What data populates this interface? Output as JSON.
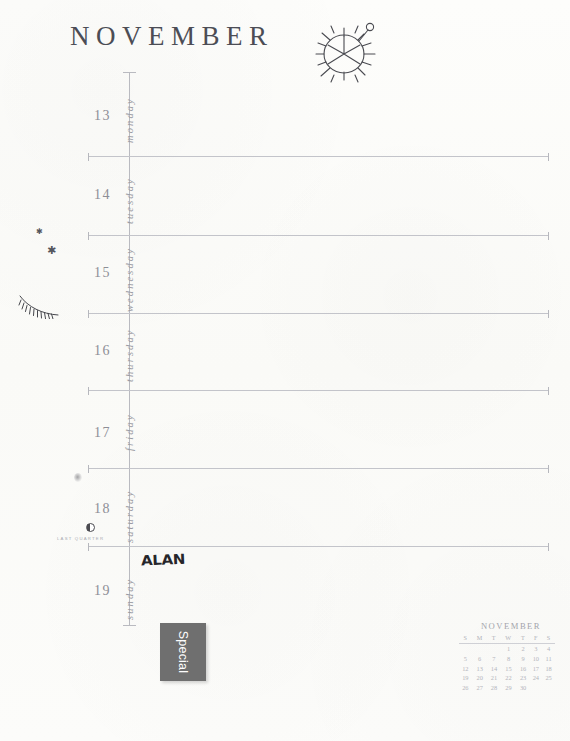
{
  "page": {
    "month_title": "NOVEMBER",
    "paper_color": "#fcfcfa",
    "ink_color": "#8d8e96",
    "rule_color": "#c3c4ca"
  },
  "doodles": {
    "sun_wheel": "sun-wheel-doodle",
    "stars": [
      "star-small",
      "star-large"
    ],
    "eyelash": "eyelash-doodle"
  },
  "days": [
    {
      "num": "13",
      "name": "monday"
    },
    {
      "num": "14",
      "name": "tuesday"
    },
    {
      "num": "15",
      "name": "wednesday"
    },
    {
      "num": "16",
      "name": "thursday"
    },
    {
      "num": "17",
      "name": "friday"
    },
    {
      "num": "18",
      "name": "saturday"
    },
    {
      "num": "19",
      "name": "sunday"
    }
  ],
  "moon": {
    "phase_label": "LAST QUARTER",
    "phase_icon": "moon-last-quarter-icon"
  },
  "entries": {
    "sunday_note": "ALAN"
  },
  "sticker": {
    "label": "Special",
    "color": "#6f6f6f",
    "text_color": "#fdfdfd"
  },
  "mini_calendar": {
    "title": "NOVEMBER",
    "weekday_headers": [
      "S",
      "M",
      "T",
      "W",
      "T",
      "F",
      "S"
    ],
    "weeks": [
      [
        "",
        "",
        "",
        "1",
        "2",
        "3",
        "4"
      ],
      [
        "5",
        "6",
        "7",
        "8",
        "9",
        "10",
        "11"
      ],
      [
        "12",
        "13",
        "14",
        "15",
        "16",
        "17",
        "18"
      ],
      [
        "19",
        "20",
        "21",
        "22",
        "23",
        "24",
        "25"
      ],
      [
        "26",
        "27",
        "28",
        "29",
        "30",
        "",
        ""
      ]
    ]
  }
}
